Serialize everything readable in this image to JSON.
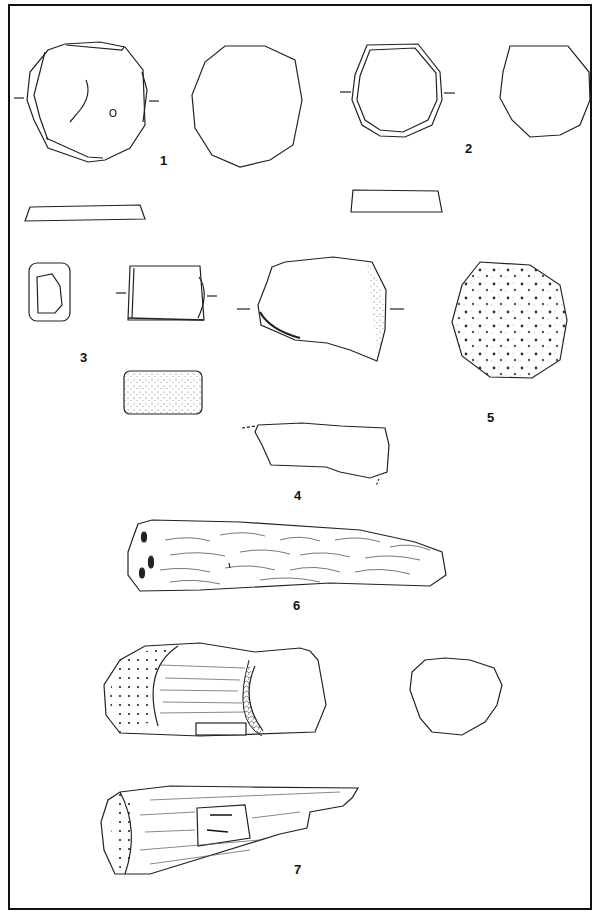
{
  "plate": {
    "border_color": "#111111",
    "background": "#ffffff",
    "line_color": "#222222"
  },
  "figures": [
    {
      "number": "1",
      "label": "1",
      "views": [
        "face-a",
        "face-b",
        "section"
      ]
    },
    {
      "number": "2",
      "label": "2",
      "views": [
        "face-a",
        "face-b",
        "section"
      ]
    },
    {
      "number": "3",
      "label": "3",
      "views": [
        "end",
        "face",
        "side"
      ]
    },
    {
      "number": "4",
      "label": "4",
      "views": [
        "face",
        "side"
      ]
    },
    {
      "number": "5",
      "label": "5",
      "views": [
        "face"
      ]
    },
    {
      "number": "6",
      "label": "6",
      "views": [
        "side"
      ]
    },
    {
      "number": "7",
      "label": "7",
      "views": [
        "side-a",
        "section",
        "side-b"
      ]
    }
  ]
}
